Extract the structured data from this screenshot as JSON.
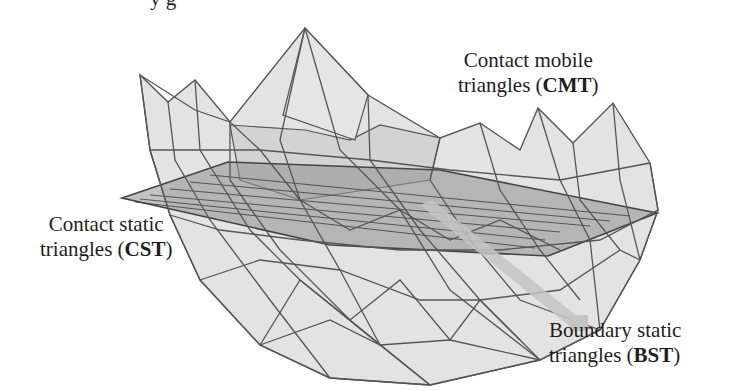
{
  "figure": {
    "top_caption_fragment": "y                                    g",
    "labels": {
      "cmt": {
        "line1": "Contact mobile",
        "line2_prefix": "triangles (",
        "abbr": "CMT",
        "line2_suffix": ")"
      },
      "cst": {
        "line1": "Contact static",
        "line2_prefix": "triangles (",
        "abbr": "CST",
        "line2_suffix": ")"
      },
      "bst": {
        "line1": "Boundary static",
        "line2_prefix": "triangles (",
        "abbr": "BST",
        "line2_suffix": ")"
      }
    },
    "colors": {
      "mesh_fill": "#d6d6d6",
      "mesh_edge": "#555555",
      "plane_fill": "#9a9a9a",
      "plane_edge": "#444444",
      "bst_marker": "#c4c4c4"
    }
  }
}
